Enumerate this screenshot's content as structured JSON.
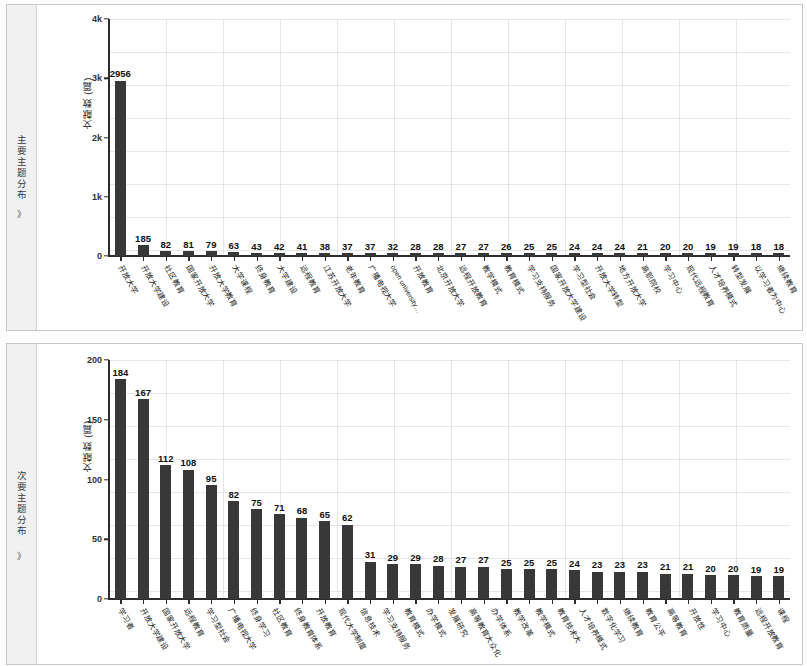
{
  "page": {
    "background": "#ffffff",
    "bar_color": "#383838",
    "grid_color": "#c8c8cd"
  },
  "panels": [
    {
      "rail_label": "主要主题分布",
      "rail_chevron": "》"
    },
    {
      "rail_label": "次要主题分布",
      "rail_chevron": "》"
    }
  ],
  "chart_data": [
    {
      "type": "bar",
      "title": "主要主题分布",
      "xlabel": "",
      "ylabel": "文献数 (篇)",
      "ylim": [
        0,
        4000
      ],
      "yticks": [
        0,
        1000,
        2000,
        3000,
        4000
      ],
      "ytick_labels": [
        "0",
        "1k",
        "2k",
        "3k",
        "4k"
      ],
      "grid": true,
      "legend": "none",
      "categories": [
        "开放大学",
        "开放大学建设",
        "社区教育",
        "国家开放大学",
        "开放大学教育",
        "大学课程",
        "终身教育",
        "大学建设",
        "远程教育",
        "江苏开放大学",
        "老年教育",
        "广播电视大学",
        "open university…",
        "开放教育",
        "北京开放大学",
        "远程开放教育",
        "教学模式",
        "教育模式",
        "学习支持服务",
        "国家开放大学建设",
        "学习型社会",
        "开放大学转型",
        "地方开放大学",
        "高职院校",
        "学习中心",
        "现代远程教育",
        "人才培养模式",
        "转型发展",
        "以学习者为中心",
        "继续教育"
      ],
      "values": [
        2956,
        185,
        82,
        81,
        79,
        63,
        43,
        42,
        41,
        38,
        37,
        37,
        32,
        28,
        28,
        27,
        27,
        26,
        25,
        25,
        24,
        24,
        24,
        21,
        20,
        20,
        19,
        19,
        18,
        18
      ]
    },
    {
      "type": "bar",
      "title": "次要主题分布",
      "xlabel": "",
      "ylabel": "文献数 (篇)",
      "ylim": [
        0,
        200
      ],
      "yticks": [
        0,
        50,
        100,
        150,
        200
      ],
      "ytick_labels": [
        "0",
        "50",
        "100",
        "150",
        "200"
      ],
      "grid": true,
      "legend": "none",
      "categories": [
        "学习者",
        "开放大学建设",
        "国家开放大学",
        "远程教育",
        "学习型社会",
        "广播电视大学",
        "终身学习",
        "社区教育",
        "终身教育体系",
        "开放教育",
        "现代大学制度",
        "信息技术",
        "学习支持服务",
        "教育模式",
        "办学模式",
        "发展研究",
        "高等教育大众化",
        "办学体系",
        "教学改革",
        "教学模式",
        "教育技术大",
        "人才培养模式",
        "数字化学习",
        "继续教育",
        "教育公平",
        "高等教育",
        "开放性",
        "学习中心",
        "教育质量",
        "远程开放教育",
        "课程"
      ],
      "values": [
        184,
        167,
        112,
        108,
        95,
        82,
        75,
        71,
        68,
        65,
        62,
        31,
        29,
        29,
        28,
        27,
        27,
        25,
        25,
        25,
        24,
        23,
        23,
        23,
        21,
        21,
        20,
        20,
        19,
        19
      ]
    }
  ]
}
